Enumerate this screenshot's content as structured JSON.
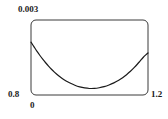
{
  "figure": {
    "background_color": "#ffffff",
    "frame_color": "#333333",
    "curve_color": "#1a1a1a"
  },
  "labels": {
    "y_max": "0.003",
    "y_min": "0.8",
    "x_min": "0",
    "x_max": "1.2"
  },
  "chart_data": {
    "type": "line",
    "title": "",
    "xlabel": "",
    "ylabel": "",
    "xlim": [
      0,
      1.2
    ],
    "ylim": [
      0.8,
      0.003
    ],
    "grid": false,
    "legend": null,
    "axis_tick_labels": {
      "x": [
        "0",
        "1.2"
      ],
      "y": [
        "0.8",
        "0.003"
      ]
    },
    "note": "Convex U-shaped curve: high at left edge, decaying steeply to a shallow minimum near x=0.55, then rising toward the right edge. Axis values are corner annotations only (y listed bottom 0.8, top 0.003).",
    "series": [
      {
        "name": "curve",
        "x": [
          0.0,
          0.03,
          0.06,
          0.09,
          0.12,
          0.15,
          0.18,
          0.21,
          0.24,
          0.28,
          0.32,
          0.36,
          0.4,
          0.45,
          0.5,
          0.55,
          0.6,
          0.65,
          0.7,
          0.75,
          0.8,
          0.85,
          0.9,
          0.94,
          0.98,
          1.02,
          1.06,
          1.09,
          1.12,
          1.15,
          1.18,
          1.2
        ],
        "y_fraction_from_top": [
          0.295,
          0.355,
          0.415,
          0.47,
          0.522,
          0.57,
          0.615,
          0.657,
          0.695,
          0.74,
          0.779,
          0.812,
          0.84,
          0.87,
          0.892,
          0.906,
          0.913,
          0.912,
          0.903,
          0.888,
          0.866,
          0.838,
          0.803,
          0.769,
          0.729,
          0.684,
          0.632,
          0.59,
          0.545,
          0.5,
          0.462,
          0.44
        ]
      }
    ]
  }
}
